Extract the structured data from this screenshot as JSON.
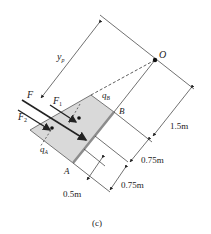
{
  "figure": {
    "caption": "(c)",
    "points": {
      "O": "O",
      "A": "A",
      "B": "B"
    },
    "forces": {
      "F": "F",
      "F1": "F",
      "F1_sub": "1",
      "F2": "F",
      "F2_sub": "2"
    },
    "loads": {
      "qA": "q",
      "qA_sub": "A",
      "qB": "q",
      "qB_sub": "B"
    },
    "distance": {
      "yp": "y",
      "yp_sub": "p"
    },
    "dimensions": [
      {
        "label": "1.5m"
      },
      {
        "label": "0.75m"
      },
      {
        "label": "0.75m"
      },
      {
        "label": "0.5m"
      }
    ],
    "colors": {
      "shade": "#d9d9d9",
      "plate": "#8c8c8c",
      "line": "#333333"
    }
  }
}
